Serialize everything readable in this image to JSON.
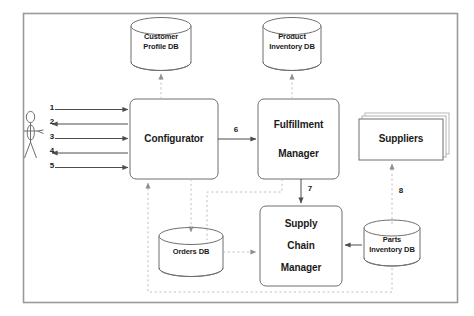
{
  "diagram": {
    "border_color": "#9a9a9a",
    "shape_stroke": "#6e6e6e",
    "solid_arrow_color": "#4d4d4d",
    "dashed_arrow_color": "#b5b5b5",
    "text_color": "#1a1a1a",
    "background": "#ffffff"
  },
  "actor": {
    "name": "stick-figure-actor",
    "label": ""
  },
  "nodes": {
    "configurator": {
      "label": "Configurator",
      "type": "process"
    },
    "fulfillment_manager": {
      "line1": "Fulfillment",
      "line2": "Manager",
      "type": "process"
    },
    "supply_chain_manager": {
      "line1": "Supply",
      "line2": "Chain",
      "line3": "Manager",
      "type": "process"
    },
    "suppliers": {
      "label": "Suppliers",
      "type": "external-stack"
    }
  },
  "datastores": {
    "customer_profile_db": {
      "line1": "Customer",
      "line2": "Profile DB"
    },
    "product_inventory_db": {
      "line1": "Product",
      "line2": "Inventory DB"
    },
    "orders_db": {
      "line1": "Orders DB",
      "line2": ""
    },
    "parts_inventory_db": {
      "line1": "Parts",
      "line2": "Inventory DB"
    }
  },
  "flow_labels": {
    "a1": "1",
    "a2": "2",
    "a3": "3",
    "a4": "4",
    "a5": "5",
    "a6": "6",
    "a7": "7",
    "a8": "8"
  },
  "flows": [
    {
      "id": "1",
      "from": "actor",
      "to": "configurator",
      "style": "solid",
      "direction": "right"
    },
    {
      "id": "2",
      "from": "configurator",
      "to": "actor",
      "style": "solid",
      "direction": "left"
    },
    {
      "id": "3",
      "from": "actor",
      "to": "configurator",
      "style": "solid",
      "direction": "right"
    },
    {
      "id": "4",
      "from": "configurator",
      "to": "actor",
      "style": "solid",
      "direction": "left"
    },
    {
      "id": "5",
      "from": "actor",
      "to": "configurator",
      "style": "solid",
      "direction": "right"
    },
    {
      "id": "6",
      "from": "configurator",
      "to": "fulfillment_manager",
      "style": "solid",
      "direction": "right"
    },
    {
      "id": "7",
      "from": "fulfillment_manager",
      "to": "supply_chain_manager",
      "style": "solid",
      "direction": "down"
    },
    {
      "id": "8",
      "from": "parts_inventory_db",
      "to": "suppliers",
      "style": "dashed",
      "direction": "up"
    },
    {
      "id": "cp",
      "from": "configurator",
      "to": "customer_profile_db",
      "style": "dashed",
      "direction": "up"
    },
    {
      "id": "pi",
      "from": "fulfillment_manager",
      "to": "product_inventory_db",
      "style": "dashed",
      "direction": "up"
    },
    {
      "id": "od1",
      "from": "configurator",
      "to": "orders_db",
      "style": "dashed",
      "direction": "down"
    },
    {
      "id": "od2",
      "from": "fulfillment_manager",
      "to": "orders_db",
      "style": "dashed",
      "direction": "down"
    },
    {
      "id": "od3",
      "from": "orders_db",
      "to": "supply_chain_manager",
      "style": "dashed",
      "direction": "right"
    },
    {
      "id": "scm_pi",
      "from": "parts_inventory_db",
      "to": "supply_chain_manager",
      "style": "solid",
      "direction": "left"
    },
    {
      "id": "loop",
      "from": "parts_inventory_db",
      "to": "configurator",
      "style": "dashed",
      "direction": "up"
    }
  ]
}
